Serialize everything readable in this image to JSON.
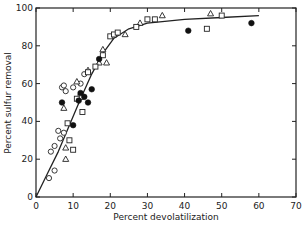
{
  "chart_data": {
    "type": "scatter",
    "title": "",
    "xlabel": "Percent devolatilization",
    "ylabel": "Percent sulfur removal",
    "xlim": [
      0,
      70
    ],
    "ylim": [
      0,
      100
    ],
    "xticks": [
      0,
      10,
      20,
      30,
      40,
      50,
      60,
      70
    ],
    "yticks": [
      0,
      20,
      40,
      60,
      80,
      100
    ],
    "grid": false,
    "legend": "none",
    "series": [
      {
        "name": "open circles",
        "marker": "circle-open",
        "points": [
          [
            3.5,
            10
          ],
          [
            5,
            14
          ],
          [
            4,
            24
          ],
          [
            5,
            27
          ],
          [
            6,
            35
          ],
          [
            6.5,
            31
          ],
          [
            7.5,
            34
          ],
          [
            7,
            58
          ],
          [
            7.5,
            59
          ],
          [
            8,
            56
          ],
          [
            10,
            58
          ],
          [
            13,
            65
          ],
          [
            12,
            60
          ]
        ]
      },
      {
        "name": "open triangles",
        "marker": "triangle-open",
        "points": [
          [
            8,
            20
          ],
          [
            8,
            26
          ],
          [
            7.5,
            47
          ],
          [
            11,
            61
          ],
          [
            14,
            67
          ],
          [
            17,
            71
          ],
          [
            18,
            78
          ],
          [
            19,
            71
          ],
          [
            24,
            86
          ],
          [
            28,
            92
          ],
          [
            34,
            96
          ],
          [
            47,
            97
          ]
        ]
      },
      {
        "name": "open squares",
        "marker": "square-open",
        "points": [
          [
            9,
            30
          ],
          [
            10,
            25
          ],
          [
            8.5,
            39
          ],
          [
            12,
            53
          ],
          [
            11,
            52
          ],
          [
            14,
            66
          ],
          [
            16,
            69
          ],
          [
            18,
            75
          ],
          [
            20,
            85
          ],
          [
            21,
            86
          ],
          [
            22,
            87
          ],
          [
            27,
            90
          ],
          [
            30,
            94
          ],
          [
            32,
            94
          ],
          [
            50,
            96
          ],
          [
            46,
            89
          ],
          [
            12.5,
            45
          ]
        ]
      },
      {
        "name": "filled circles",
        "marker": "circle-filled",
        "points": [
          [
            10,
            38
          ],
          [
            7,
            50
          ],
          [
            11.5,
            51
          ],
          [
            12,
            55
          ],
          [
            13,
            53
          ],
          [
            14,
            50
          ],
          [
            15,
            57
          ],
          [
            17,
            73
          ],
          [
            41,
            88
          ],
          [
            58,
            92
          ]
        ]
      }
    ],
    "fit_curve": {
      "description": "smooth trend line rising steeply then plateauing near 95-96%",
      "points": [
        [
          0,
          0
        ],
        [
          3,
          12
        ],
        [
          6,
          24
        ],
        [
          9,
          38
        ],
        [
          12,
          52
        ],
        [
          15,
          65
        ],
        [
          18,
          76
        ],
        [
          21,
          84
        ],
        [
          25,
          89
        ],
        [
          30,
          92
        ],
        [
          40,
          94
        ],
        [
          50,
          95
        ],
        [
          60,
          96
        ]
      ]
    }
  }
}
